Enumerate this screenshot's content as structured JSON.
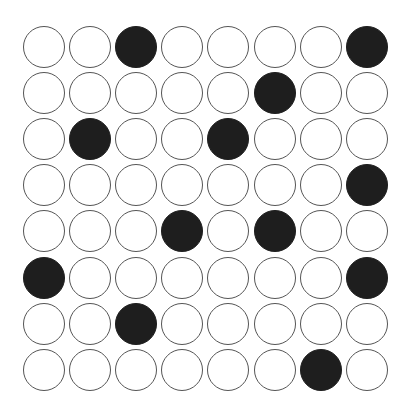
{
  "board": {
    "rows": 8,
    "cols": 8,
    "colors": {
      "filled": "#1e1e1e",
      "empty": "#ffffff",
      "outline": "#555555"
    },
    "grid": [
      [
        0,
        0,
        1,
        0,
        0,
        0,
        0,
        1
      ],
      [
        0,
        0,
        0,
        0,
        0,
        1,
        0,
        0
      ],
      [
        0,
        1,
        0,
        0,
        1,
        0,
        0,
        0
      ],
      [
        0,
        0,
        0,
        0,
        0,
        0,
        0,
        1
      ],
      [
        0,
        0,
        0,
        1,
        0,
        1,
        0,
        0
      ],
      [
        1,
        0,
        0,
        0,
        0,
        0,
        0,
        1
      ],
      [
        0,
        0,
        1,
        0,
        0,
        0,
        0,
        0
      ],
      [
        0,
        0,
        0,
        0,
        0,
        0,
        1,
        0
      ]
    ]
  }
}
